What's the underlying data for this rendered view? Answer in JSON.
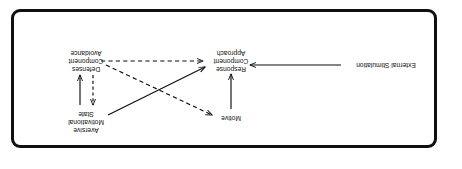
{
  "figure": {
    "orientation": "rotated-180",
    "frame_color": "#101010",
    "background": "#ffffff",
    "text_color": "#0d0d0d"
  },
  "nodes": [
    {
      "id": "aversive-motivational-state",
      "lines": [
        "Aversive",
        "Motivational",
        "State"
      ],
      "line1": "Aversive",
      "line2": "Motivational",
      "line3": "State"
    },
    {
      "id": "avoidance-component-defenses",
      "lines": [
        "Avoidance",
        "Component",
        "Defenses"
      ],
      "line1": "Avoidance",
      "line2": "Component",
      "line3": "Defenses"
    },
    {
      "id": "motive",
      "lines": [
        "Motive"
      ],
      "line1": "Motive"
    },
    {
      "id": "approach-component-response",
      "lines": [
        "Approach",
        "Component",
        "Response"
      ],
      "line1": "Approach",
      "line2": "Component",
      "line3": "Response"
    },
    {
      "id": "external-stimulation",
      "lines": [
        "External Stimulation"
      ],
      "line1": "External Stimulation"
    }
  ],
  "edges": [
    {
      "id": "defenses-to-aversive",
      "from": "avoidance-component-defenses",
      "to": "aversive-motivational-state",
      "style": "dashed",
      "arrow": "up"
    },
    {
      "id": "aversive-to-defenses",
      "from": "aversive-motivational-state",
      "to": "avoidance-component-defenses",
      "style": "solid",
      "arrow": "down"
    },
    {
      "id": "motive-to-approach",
      "from": "motive",
      "to": "approach-component-response",
      "style": "solid",
      "arrow": "down"
    },
    {
      "id": "external-to-approach",
      "from": "external-stimulation",
      "to": "approach-component-response",
      "style": "solid",
      "arrow": "left"
    },
    {
      "id": "avoidance-to-approach",
      "from": "avoidance-component-defenses",
      "to": "approach-component-response",
      "style": "dashed",
      "arrow": "right"
    },
    {
      "id": "avoidance-to-motive",
      "from": "avoidance-component-defenses",
      "to": "motive",
      "style": "dashed",
      "arrow": "up-right"
    },
    {
      "id": "aversive-to-approach",
      "from": "aversive-motivational-state",
      "to": "approach-component-response",
      "style": "solid",
      "arrow": "down-right"
    }
  ]
}
